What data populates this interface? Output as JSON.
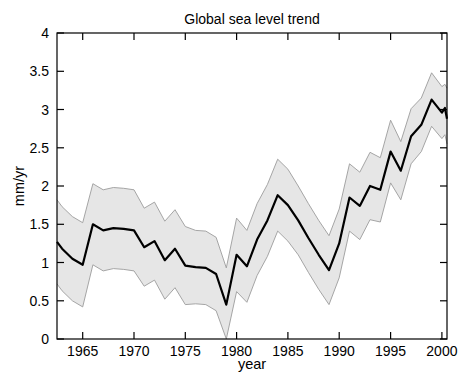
{
  "chart_data": {
    "type": "line",
    "title": "Global sea level trend",
    "xlabel": "year",
    "ylabel": "mm/yr",
    "xlim": [
      1962.5,
      2000.5
    ],
    "ylim": [
      0,
      4
    ],
    "xticks": [
      1965,
      1970,
      1975,
      1980,
      1985,
      1990,
      1995,
      2000
    ],
    "yticks": [
      0,
      0.5,
      1,
      1.5,
      2,
      2.5,
      3,
      3.5,
      4
    ],
    "grid": false,
    "legend": "none",
    "box": true,
    "colors": {
      "line": "#000000",
      "band_fill": "#e6e6e6",
      "band_edge": "#9c9c9c",
      "axis": "#000000",
      "text": "#000000"
    },
    "x": [
      1962.5,
      1963,
      1964,
      1965,
      1966,
      1967,
      1968,
      1969,
      1970,
      1971,
      1972,
      1973,
      1974,
      1975,
      1976,
      1977,
      1978,
      1979,
      1980,
      1981,
      1982,
      1983,
      1984,
      1985,
      1986,
      1987,
      1988,
      1989,
      1990,
      1991,
      1992,
      1993,
      1994,
      1995,
      1996,
      1997,
      1998,
      1999,
      2000,
      2000.3,
      2000.5
    ],
    "series": [
      {
        "name": "sea level trend (mm/yr)",
        "role": "line",
        "values": [
          1.27,
          1.18,
          1.05,
          0.97,
          1.5,
          1.42,
          1.45,
          1.44,
          1.42,
          1.2,
          1.28,
          1.03,
          1.18,
          0.96,
          0.94,
          0.93,
          0.85,
          0.45,
          1.1,
          0.95,
          1.3,
          1.55,
          1.88,
          1.75,
          1.55,
          1.32,
          1.1,
          0.9,
          1.25,
          1.85,
          1.74,
          2.0,
          1.95,
          2.45,
          2.2,
          2.65,
          2.8,
          3.13,
          2.96,
          3.02,
          2.88
        ]
      },
      {
        "name": "uncertainty upper bound",
        "role": "band-upper",
        "values": [
          1.82,
          1.73,
          1.6,
          1.52,
          2.03,
          1.95,
          1.98,
          1.97,
          1.95,
          1.71,
          1.79,
          1.54,
          1.69,
          1.47,
          1.42,
          1.41,
          1.33,
          0.93,
          1.58,
          1.42,
          1.77,
          2.02,
          2.35,
          2.22,
          2.0,
          1.77,
          1.55,
          1.35,
          1.7,
          2.29,
          2.18,
          2.44,
          2.37,
          2.86,
          2.58,
          3.01,
          3.15,
          3.48,
          3.3,
          3.33,
          3.28
        ]
      },
      {
        "name": "uncertainty lower bound",
        "role": "band-lower",
        "values": [
          0.72,
          0.63,
          0.5,
          0.42,
          0.97,
          0.89,
          0.92,
          0.91,
          0.89,
          0.69,
          0.77,
          0.52,
          0.67,
          0.45,
          0.46,
          0.45,
          0.37,
          0.0,
          0.62,
          0.48,
          0.83,
          1.08,
          1.41,
          1.28,
          1.1,
          0.87,
          0.65,
          0.45,
          0.8,
          1.41,
          1.3,
          1.56,
          1.53,
          2.04,
          1.82,
          2.29,
          2.45,
          2.78,
          2.62,
          2.67,
          2.55
        ]
      }
    ]
  }
}
